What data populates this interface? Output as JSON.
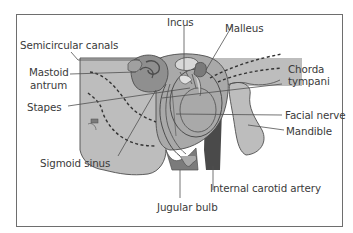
{
  "figure": {
    "colors": {
      "frame": "#6e6e6e",
      "bone_light": "#bdbdbd",
      "bone_mid": "#a9a9a9",
      "ossicle_dark": "#8a8a8a",
      "vessel_dark": "#4a4a4a",
      "vessel_mid": "#7b7b7b",
      "outline": "#4d4d4d",
      "leader": "#505050",
      "text": "#3a3a3a"
    },
    "labels": [
      {
        "id": "incus",
        "text": "Incus"
      },
      {
        "id": "malleus",
        "text": "Malleus"
      },
      {
        "id": "semicircular_canals",
        "text": "Semicircular canals"
      },
      {
        "id": "chorda_tympani_1",
        "text": "Chorda"
      },
      {
        "id": "chorda_tympani_2",
        "text": "tympani"
      },
      {
        "id": "mastoid_antrum_1",
        "text": "Mastoid"
      },
      {
        "id": "mastoid_antrum_2",
        "text": "antrum"
      },
      {
        "id": "stapes",
        "text": "Stapes"
      },
      {
        "id": "facial_nerve",
        "text": "Facial nerve"
      },
      {
        "id": "mandible",
        "text": "Mandible"
      },
      {
        "id": "sigmoid_sinus",
        "text": "Sigmoid sinus"
      },
      {
        "id": "internal_carotid_artery",
        "text": "Internal carotid artery"
      },
      {
        "id": "jugular_bulb",
        "text": "Jugular bulb"
      }
    ]
  }
}
